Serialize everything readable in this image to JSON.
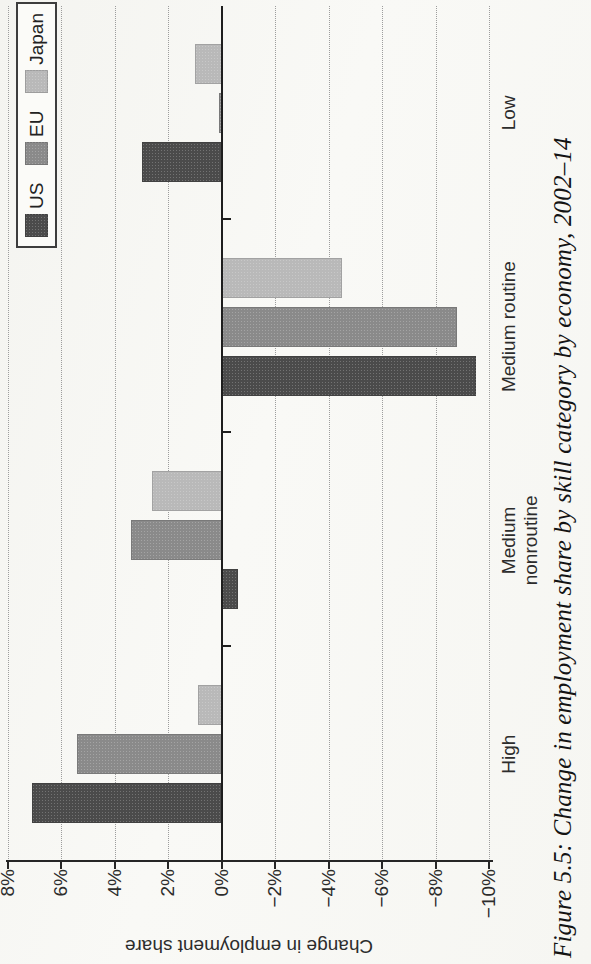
{
  "figure": {
    "caption": "Figure 5.5: Change in employment share by skill category by economy, 2002–14"
  },
  "chart_data": {
    "type": "bar",
    "title": "",
    "xlabel": "",
    "ylabel": "Change in employment share",
    "categories": [
      "High",
      "Medium\nnonroutine",
      "Medium routine",
      "Low"
    ],
    "series": [
      {
        "name": "US",
        "color": "#4b4b4b",
        "values": [
          7.1,
          -0.6,
          -9.5,
          3.0
        ]
      },
      {
        "name": "EU",
        "color": "#8a8a8a",
        "values": [
          5.4,
          3.4,
          -8.8,
          0.1
        ]
      },
      {
        "name": "Japan",
        "color": "#b9b9b9",
        "values": [
          0.9,
          2.6,
          -4.5,
          1.0
        ]
      }
    ],
    "ylim": [
      -10,
      8
    ],
    "ytick_step": 2,
    "ytick_labels": [
      "8%",
      "6%",
      "4%",
      "2%",
      "0%",
      "−2%",
      "−4%",
      "−6%",
      "−8%",
      "−10%"
    ],
    "grid": "dotted",
    "legend_position": "top-right",
    "page_rotation_deg": -90
  }
}
